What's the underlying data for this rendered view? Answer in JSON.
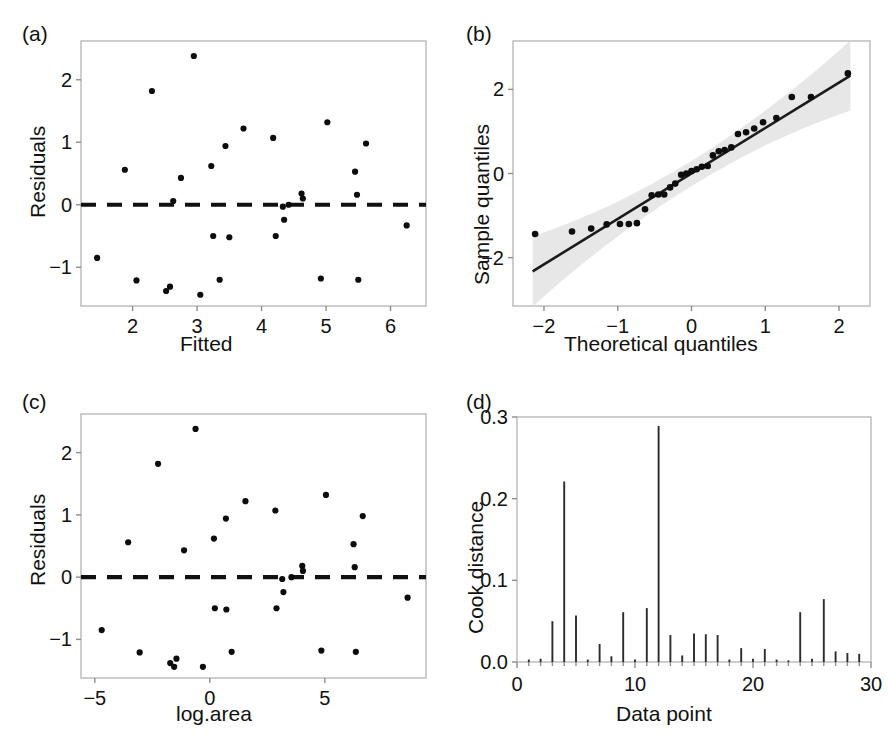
{
  "figure": {
    "panels": [
      "(a)",
      "(b)",
      "(c)",
      "(d)"
    ]
  },
  "chart_data": [
    {
      "panel": "(a)",
      "type": "scatter",
      "title": "",
      "xlabel": "Fitted",
      "ylabel": "Residuals",
      "xlim": [
        1.2,
        6.55
      ],
      "ylim": [
        -1.62,
        2.62
      ],
      "xticks": [
        2,
        3,
        4,
        5,
        6
      ],
      "yticks": [
        -1,
        0,
        1,
        2
      ],
      "grid": false,
      "reference_line": {
        "type": "hline",
        "y": 0,
        "style": "dashed"
      },
      "x": [
        1.45,
        1.88,
        2.06,
        2.3,
        2.52,
        2.58,
        2.63,
        2.75,
        2.95,
        3.05,
        3.22,
        3.25,
        3.35,
        3.44,
        3.5,
        3.72,
        4.18,
        4.22,
        4.33,
        4.35,
        4.42,
        4.62,
        4.64,
        4.92,
        5.02,
        5.45,
        5.48,
        5.5,
        5.62,
        6.25
      ],
      "y": [
        -0.85,
        0.56,
        -1.21,
        1.82,
        -1.38,
        -1.31,
        0.06,
        0.43,
        2.38,
        -1.44,
        0.62,
        -0.5,
        -1.2,
        0.94,
        -0.52,
        1.22,
        1.07,
        -0.5,
        -0.03,
        -0.24,
        0.0,
        0.18,
        0.1,
        -1.18,
        1.32,
        0.53,
        0.16,
        -1.2,
        0.98,
        -0.33
      ]
    },
    {
      "panel": "(b)",
      "type": "scatter",
      "title": "",
      "xlabel": "Theoretical quantiles",
      "ylabel": "Sample quantiles",
      "xlim": [
        -2.42,
        2.42
      ],
      "ylim": [
        -3.15,
        3.15
      ],
      "xticks": [
        -2,
        -1,
        0,
        1,
        2
      ],
      "yticks": [
        -2,
        0,
        2
      ],
      "grid": false,
      "reference_line": {
        "type": "qqline",
        "slope": 1.08,
        "intercept": 0.0
      },
      "confidence_band": true,
      "x": [
        -2.12,
        -1.62,
        -1.36,
        -1.15,
        -0.97,
        -0.85,
        -0.74,
        -0.63,
        -0.54,
        -0.45,
        -0.37,
        -0.29,
        -0.22,
        -0.14,
        -0.07,
        0.0,
        0.07,
        0.14,
        0.22,
        0.29,
        0.37,
        0.45,
        0.54,
        0.63,
        0.74,
        0.85,
        0.97,
        1.15,
        1.36,
        1.62,
        2.12
      ],
      "y": [
        -1.44,
        -1.38,
        -1.31,
        -1.21,
        -1.2,
        -1.2,
        -1.18,
        -0.85,
        -0.52,
        -0.5,
        -0.5,
        -0.33,
        -0.24,
        -0.03,
        0.0,
        0.06,
        0.1,
        0.16,
        0.18,
        0.43,
        0.53,
        0.56,
        0.62,
        0.94,
        0.98,
        1.07,
        1.22,
        1.32,
        1.82,
        1.82,
        2.38
      ]
    },
    {
      "panel": "(c)",
      "type": "scatter",
      "title": "",
      "xlabel": "log.area",
      "ylabel": "Residuals",
      "xlim": [
        -5.6,
        9.4
      ],
      "ylim": [
        -1.62,
        2.62
      ],
      "xticks": [
        -5,
        0,
        5
      ],
      "yticks": [
        -1,
        0,
        1,
        2
      ],
      "grid": false,
      "reference_line": {
        "type": "hline",
        "y": 0,
        "style": "dashed"
      },
      "x": [
        -4.7,
        -3.55,
        -3.05,
        -2.25,
        -1.72,
        -1.55,
        -1.45,
        -1.12,
        -0.62,
        -0.3,
        0.18,
        0.22,
        0.7,
        0.72,
        0.95,
        1.55,
        2.85,
        2.9,
        3.15,
        3.2,
        3.55,
        4.02,
        4.05,
        4.85,
        5.05,
        6.25,
        6.3,
        6.35,
        6.65,
        8.6
      ],
      "y": [
        -0.85,
        0.56,
        -1.21,
        1.82,
        -1.38,
        -1.44,
        -1.31,
        0.43,
        2.38,
        -1.44,
        0.62,
        -0.5,
        0.94,
        -0.52,
        -1.2,
        1.22,
        1.07,
        -0.5,
        -0.03,
        -0.24,
        0.0,
        0.18,
        0.1,
        -1.18,
        1.32,
        0.53,
        0.16,
        -1.2,
        0.98,
        -0.33
      ]
    },
    {
      "panel": "(d)",
      "type": "bar",
      "title": "",
      "xlabel": "Data point",
      "ylabel": "Cook distance",
      "xlim": [
        0,
        30
      ],
      "ylim": [
        0.0,
        0.3
      ],
      "xticks": [
        0,
        10,
        20,
        30
      ],
      "yticks": [
        "0.0",
        "0.1",
        "0.2",
        "0.3"
      ],
      "grid": false,
      "categories": [
        1,
        2,
        3,
        4,
        5,
        6,
        7,
        8,
        9,
        10,
        11,
        12,
        13,
        14,
        15,
        16,
        17,
        18,
        19,
        20,
        21,
        22,
        23,
        24,
        25,
        26,
        27,
        28,
        29
      ],
      "values": [
        0.003,
        0.004,
        0.05,
        0.221,
        0.057,
        0.003,
        0.022,
        0.007,
        0.061,
        0.003,
        0.066,
        0.289,
        0.033,
        0.008,
        0.035,
        0.034,
        0.033,
        0.003,
        0.017,
        0.004,
        0.016,
        0.003,
        0.002,
        0.061,
        0.004,
        0.077,
        0.013,
        0.011,
        0.01
      ]
    }
  ]
}
